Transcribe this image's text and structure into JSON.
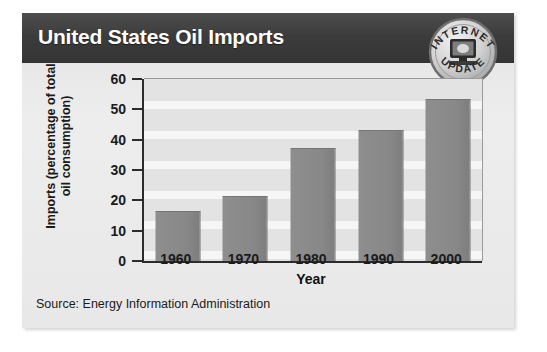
{
  "header": {
    "title": "United States Oil Imports"
  },
  "badge": {
    "name": "internet-update-seal",
    "top_text": "INTERNET",
    "bottom_text": "UPDATE",
    "icon": "computer-monitor-icon"
  },
  "source": {
    "label": "Source:",
    "text": "Energy Information Administration",
    "full": "Source:  Energy Information Administration"
  },
  "colors": {
    "header_bar": "#3c3c3c",
    "card": "#e9e9e9",
    "bar_fill": "#8a8a8a",
    "axis": "#2c2c2c",
    "plot_band_dark": "#e3e3e3",
    "plot_band_light": "#f6f6f6",
    "text": "#1b1b1b"
  },
  "chart_data": {
    "type": "bar",
    "title": "United States Oil Imports",
    "categories": [
      "1960",
      "1970",
      "1980",
      "1990",
      "2000"
    ],
    "values": [
      16,
      21,
      37,
      43,
      53
    ],
    "xlabel": "Year",
    "ylabel": "Imports (percentage of total oil consumption)",
    "ylabel_line1": "Imports (percentage of total",
    "ylabel_line2": "oil consumption)",
    "yticks": [
      0,
      10,
      20,
      30,
      40,
      50,
      60
    ],
    "ylim": [
      0,
      60
    ],
    "grid": true,
    "legend": null,
    "source": "Source: Energy Information Administration"
  }
}
